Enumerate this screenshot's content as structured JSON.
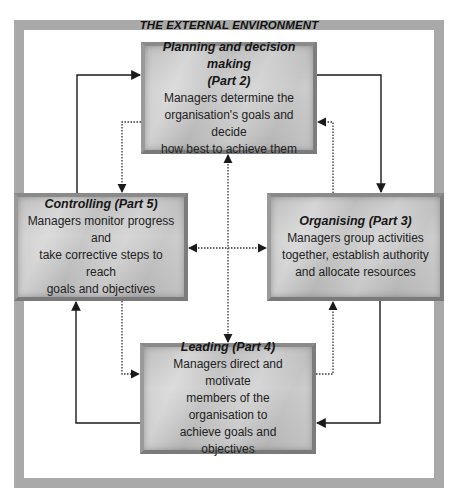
{
  "diagram": {
    "environment_label": "THE EXTERNAL ENVIRONMENT",
    "colors": {
      "frame": "#a9a9a9",
      "box_fill": "#c0c0c0",
      "arrow": "#1a1a1a"
    },
    "boxes": {
      "planning": {
        "title": "Planning and decision making (Part 2)",
        "title_line1": "Planning and decision making",
        "title_line2": "(Part 2)",
        "description_lines": [
          "Managers determine the",
          "organisation's goals and decide",
          "how best to achieve them"
        ]
      },
      "controlling": {
        "title": "Controlling (Part 5)",
        "description_lines": [
          "Managers monitor progress and",
          "take corrective steps to reach",
          "goals and objectives"
        ]
      },
      "organising": {
        "title": "Organising (Part 3)",
        "description_lines": [
          "Managers group activities",
          "together, establish authority",
          "and allocate resources"
        ]
      },
      "leading": {
        "title": "Leading (Part 4)",
        "description_lines": [
          "Managers direct and motivate",
          "members of the organisation to",
          "achieve goals and objectives"
        ]
      }
    },
    "connections": [
      {
        "from": "controlling",
        "to": "planning",
        "style": "solid"
      },
      {
        "from": "planning",
        "to": "organising",
        "style": "solid"
      },
      {
        "from": "organising",
        "to": "leading",
        "style": "solid"
      },
      {
        "from": "leading",
        "to": "controlling",
        "style": "solid"
      },
      {
        "from": "planning",
        "to": "controlling",
        "style": "dotted"
      },
      {
        "from": "organising",
        "to": "planning",
        "style": "dotted"
      },
      {
        "from": "leading",
        "to": "organising",
        "style": "dotted"
      },
      {
        "from": "controlling",
        "to": "leading",
        "style": "dotted"
      },
      {
        "from": "planning",
        "to": "leading",
        "style": "dotted",
        "bidirectional": true
      },
      {
        "from": "controlling",
        "to": "organising",
        "style": "dotted",
        "bidirectional": true
      }
    ]
  }
}
